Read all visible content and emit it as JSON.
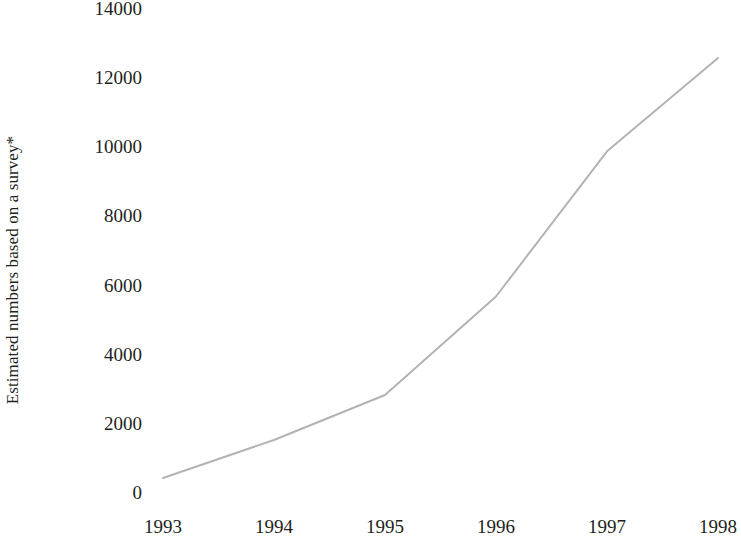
{
  "chart_data": {
    "type": "line",
    "title": "",
    "subtitle": "",
    "xlabel": "",
    "ylabel": "Estimated numbers based on a survey*",
    "categories": [
      "1993",
      "1994",
      "1995",
      "1996",
      "1997",
      "1998"
    ],
    "x": [
      1993,
      1994,
      1995,
      1996,
      1997,
      1998
    ],
    "series": [
      {
        "name": "Estimated numbers based on a survey*",
        "values": [
          550,
          1650,
          2950,
          5800,
          10000,
          12700
        ],
        "color": "#b3b3b3"
      }
    ],
    "values": [
      550,
      1650,
      2950,
      5800,
      10000,
      12700
    ],
    "ylim": [
      0,
      14000
    ],
    "yticks": [
      0,
      2000,
      4000,
      6000,
      8000,
      10000,
      12000,
      14000
    ],
    "ytick_labels": [
      "0",
      "2000",
      "4000",
      "6000",
      "8000",
      "10000",
      "12000",
      "14000"
    ],
    "xticks": [
      1993,
      1994,
      1995,
      1996,
      1997,
      1998
    ],
    "xtick_labels": [
      "1993",
      "1994",
      "1995",
      "1996",
      "1997",
      "1998"
    ],
    "grid": false,
    "legend": false,
    "legend_position": "none",
    "annotations": [],
    "line_color": "#b3b3b3",
    "line_width": 2,
    "markers": false,
    "background_color": "#ffffff",
    "text_color": "#231f20"
  }
}
